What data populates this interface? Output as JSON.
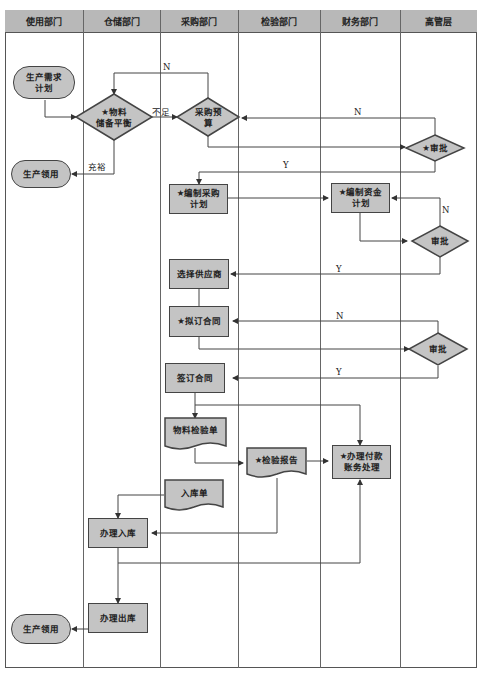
{
  "lanes": [
    {
      "label": "使用部门"
    },
    {
      "label": "仓储部门"
    },
    {
      "label": "采购部门"
    },
    {
      "label": "检验部门"
    },
    {
      "label": "财务部门"
    },
    {
      "label": "高管层"
    }
  ],
  "nodes": {
    "demand_plan": "生产需求\n计划",
    "stock_balance": "★物料\n储备平衡",
    "purchase_budget": "采购预\n算",
    "exec_approval_1": "★审批",
    "production_use_1": "生产领用",
    "purchase_plan": "★编制采购\n计划",
    "fund_plan": "★编制资金\n计划",
    "finance_approval": "审批",
    "select_supplier": "选择供应商",
    "draft_contract": "★拟订合同",
    "exec_approval_2": "审批",
    "sign_contract": "签订合同",
    "inspection_sheet": "物料检验单",
    "inspection_report": "★检验报告",
    "payment": "★办理付款\n账务处理",
    "warehouse_receipt": "入库单",
    "store_in": "办理入库",
    "store_out": "办理出库",
    "production_use_2": "生产领用"
  },
  "edge_labels": {
    "n1": "N",
    "insufficient": "不足",
    "sufficient": "充裕",
    "n2": "N",
    "y1": "Y",
    "n3": "N",
    "y2": "Y",
    "n4": "N",
    "y3": "Y"
  },
  "colors": {
    "header_fill": "#b8b8b8",
    "node_fill": "#c4c4c4",
    "line": "#444444"
  }
}
